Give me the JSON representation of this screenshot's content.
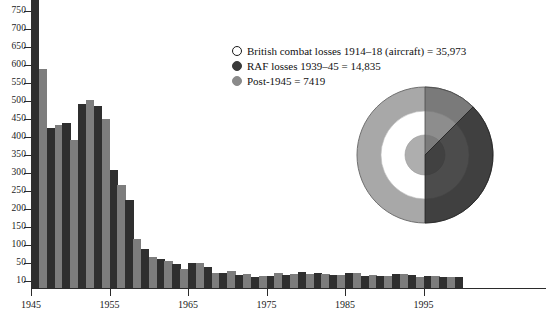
{
  "chart_data": {
    "type": "bar",
    "xlabel": "",
    "ylabel": "",
    "ylim": [
      10,
      780
    ],
    "grid": false,
    "y_ticks": [
      750,
      700,
      650,
      600,
      550,
      500,
      450,
      400,
      350,
      300,
      250,
      200,
      150,
      100,
      50,
      10
    ],
    "x_ticks": [
      "1945",
      "1955",
      "1965",
      "1975",
      "1985",
      "1995"
    ],
    "categories": [
      "1945",
      "1946",
      "1947",
      "1948",
      "1949",
      "1950",
      "1951",
      "1952",
      "1953",
      "1954",
      "1955",
      "1956",
      "1957",
      "1958",
      "1959",
      "1960",
      "1961",
      "1962",
      "1963",
      "1964",
      "1965",
      "1966",
      "1967",
      "1968",
      "1969",
      "1970",
      "1971",
      "1972",
      "1973",
      "1974",
      "1975",
      "1976",
      "1977",
      "1978",
      "1979",
      "1980",
      "1981",
      "1982",
      "1983",
      "1984",
      "1985",
      "1986",
      "1987",
      "1988",
      "1989",
      "1990",
      "1991",
      "1992",
      "1993",
      "1994",
      "1995",
      "1996",
      "1997",
      "1998",
      "1999"
    ],
    "values": [
      1050,
      590,
      425,
      432,
      440,
      392,
      493,
      502,
      485,
      450,
      308,
      268,
      226,
      116,
      88,
      67,
      62,
      56,
      48,
      33,
      49,
      50,
      40,
      21,
      23,
      27,
      18,
      19,
      12,
      14,
      15,
      22,
      17,
      19,
      24,
      20,
      21,
      19,
      17,
      18,
      23,
      22,
      15,
      16,
      13,
      14,
      19,
      20,
      17,
      12,
      13,
      14,
      11,
      10,
      12
    ],
    "bar_colors": [
      "#2f2f2f",
      "#7d7d7d"
    ],
    "bar_color_pattern": "alternating dark / medium grey by year",
    "legend_position": "upper right",
    "legend": [
      {
        "label": "British combat losses 1914–18 (aircraft) = 35,973",
        "marker": "open-circle",
        "color": "#ffffff",
        "value": 35973
      },
      {
        "label": "RAF losses 1939–45 = 14,835",
        "marker": "filled-circle",
        "color": "#3a3a3a",
        "value": 14835
      },
      {
        "label": "Post-1945 = 7419",
        "marker": "filled-circle",
        "color": "#8a8a8a",
        "value": 7419
      }
    ],
    "inset_chart": {
      "type": "pie",
      "description": "proportional area circles with overlaid wedges",
      "slices": [
        {
          "name": "British combat losses 1914–18 (aircraft)",
          "value": 35973,
          "color": "#ffffff"
        },
        {
          "name": "RAF losses 1939–45",
          "value": 14835,
          "color": "#3a3a3a"
        },
        {
          "name": "Post-1945",
          "value": 7419,
          "color": "#8a8a8a"
        }
      ]
    }
  },
  "axes": {
    "y_labels": [
      "750",
      "700",
      "650",
      "600",
      "550",
      "500",
      "450",
      "400",
      "350",
      "300",
      "250",
      "200",
      "150",
      "100",
      "50",
      "10"
    ],
    "x_labels": [
      "1945",
      "1955",
      "1965",
      "1975",
      "1985",
      "1995"
    ]
  },
  "legend": {
    "items": [
      {
        "label": "British combat losses 1914–18 (aircraft) = 35,973"
      },
      {
        "label": "RAF losses 1939–45 = 14,835"
      },
      {
        "label": "Post-1945 = 7419"
      }
    ]
  },
  "title_fragment": ""
}
